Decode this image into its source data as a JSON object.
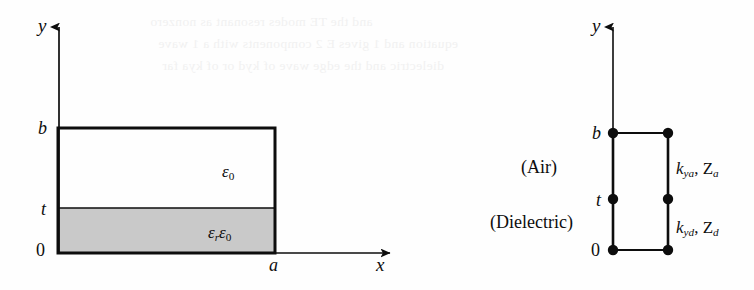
{
  "figure": {
    "kind": "waveguide-cross-section-and-transverse-equivalent-network",
    "background_ghost_text": [
      "and the TE modes resonant as    nonzero",
      "equation and 1 gives E 2 components with a  1 wave",
      "dielectric and the edge wave of  kyd  or  of  kya  far"
    ]
  },
  "left_diagram": {
    "name": "waveguide-cross-section",
    "y_axis_label": "y",
    "x_axis_label": "x",
    "y_ticks": [
      {
        "key": "b",
        "label": "b"
      },
      {
        "key": "t",
        "label": "t"
      },
      {
        "key": "0",
        "label": "0"
      }
    ],
    "x_ticks": [
      {
        "key": "a",
        "label": "a"
      }
    ],
    "regions": [
      {
        "key": "air-region",
        "permittivity_main": "ε",
        "permittivity_sub": "0",
        "fill": "#ffffff"
      },
      {
        "key": "dielectric-region",
        "permittivity_prefix": "ε",
        "permittivity_prefix_sub": "r",
        "permittivity_main": "ε",
        "permittivity_sub": "0",
        "fill": "#c9c9c9"
      }
    ]
  },
  "right_diagram": {
    "name": "transverse-equivalent-network",
    "y_axis_label": "y",
    "y_ticks": [
      {
        "key": "b",
        "label": "b"
      },
      {
        "key": "t",
        "label": "t"
      },
      {
        "key": "0",
        "label": "0"
      }
    ],
    "section_labels": [
      {
        "key": "air",
        "label": "(Air)"
      },
      {
        "key": "dielectric",
        "label": "(Dielectric)"
      }
    ],
    "line_parameters": [
      {
        "key": "air-line",
        "k_symbol": "k",
        "k_sub": "ya",
        "separator": ", ",
        "z_symbol": "Z",
        "z_sub": "a"
      },
      {
        "key": "dielectric-line",
        "k_symbol": "k",
        "k_sub": "yd",
        "separator": ", ",
        "z_symbol": "Z",
        "z_sub": "d"
      }
    ],
    "terminal_dots": 6
  },
  "colors": {
    "ink": "#0d0d0d",
    "dielectric_fill": "#c9c9c9",
    "page": "#fefefe",
    "ghost": "#f1f1f1"
  }
}
